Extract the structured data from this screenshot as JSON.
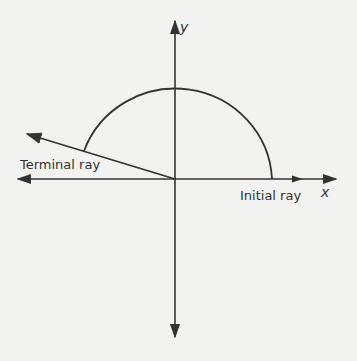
{
  "diagram": {
    "type": "angle-in-standard-position",
    "axes": {
      "x_label": "x",
      "y_label": "y"
    },
    "labels": {
      "initial_ray": "Initial ray",
      "terminal_ray": "Terminal ray"
    },
    "angle": {
      "initial_side": "positive x-axis",
      "terminal_side_quadrant": "II",
      "approx_degrees": 160,
      "arc": "counterclockwise from initial ray to terminal ray"
    },
    "colors": {
      "stroke": "#333333",
      "background": "#f2f2f0"
    }
  }
}
